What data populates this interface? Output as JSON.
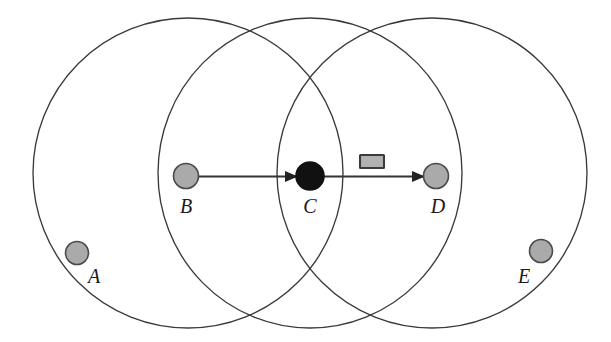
{
  "figure": {
    "background_color": "#ffffff",
    "width": 611,
    "height": 342
  },
  "style": {
    "range_circle_stroke": "#3a3a3a",
    "idle_node_fill": "#aaaaaa",
    "active_node_fill": "#111111",
    "node_stroke": "#4a4a4a",
    "link_stroke": "#333333",
    "packet_fill": "#b2b2b2",
    "packet_stroke": "#3b3b3b",
    "label_color": "#1a1a1a"
  },
  "ranges": [
    {
      "id": "range-left",
      "owner_label": "B",
      "cx": 188,
      "cy": 173,
      "rx": 155,
      "ry": 155
    },
    {
      "id": "range-middle",
      "owner_label": "C",
      "cx": 310,
      "cy": 173,
      "rx": 152,
      "ry": 155
    },
    {
      "id": "range-right",
      "owner_label": "D",
      "cx": 432,
      "cy": 173,
      "rx": 155,
      "ry": 155
    }
  ],
  "nodes": [
    {
      "id": "node-a",
      "label": "A",
      "cx": 77,
      "cy": 253,
      "r": 11.5,
      "state": "idle",
      "label_x": 94,
      "label_y": 283
    },
    {
      "id": "node-b",
      "label": "B",
      "cx": 186,
      "cy": 176,
      "r": 12.5,
      "state": "idle",
      "label_x": 186,
      "label_y": 213
    },
    {
      "id": "node-c",
      "label": "C",
      "cx": 310,
      "cy": 176,
      "r": 14.0,
      "state": "transmitting",
      "label_x": 310,
      "label_y": 213
    },
    {
      "id": "node-d",
      "label": "D",
      "cx": 436,
      "cy": 176,
      "r": 12.5,
      "state": "idle",
      "label_x": 438,
      "label_y": 213
    },
    {
      "id": "node-e",
      "label": "E",
      "cx": 541,
      "cy": 251,
      "r": 11.5,
      "state": "idle",
      "label_x": 524,
      "label_y": 283
    }
  ],
  "links": [
    {
      "id": "link-b-to-c",
      "from": "B",
      "to": "C",
      "x1": 198,
      "y1": 176,
      "x2": 296,
      "y2": 176,
      "arrow": "end"
    },
    {
      "id": "link-c-to-d",
      "from": "C",
      "to": "D",
      "x1": 322,
      "y1": 176,
      "x2": 423,
      "y2": 176,
      "arrow": "end"
    }
  ],
  "packet": {
    "id": "packet-symbol",
    "label": "data packet",
    "x": 360,
    "y": 155,
    "width": 24,
    "height": 13
  },
  "legend_text": {
    "node_a": "A",
    "node_b": "B",
    "node_c": "C",
    "node_d": "D",
    "node_e": "E"
  }
}
